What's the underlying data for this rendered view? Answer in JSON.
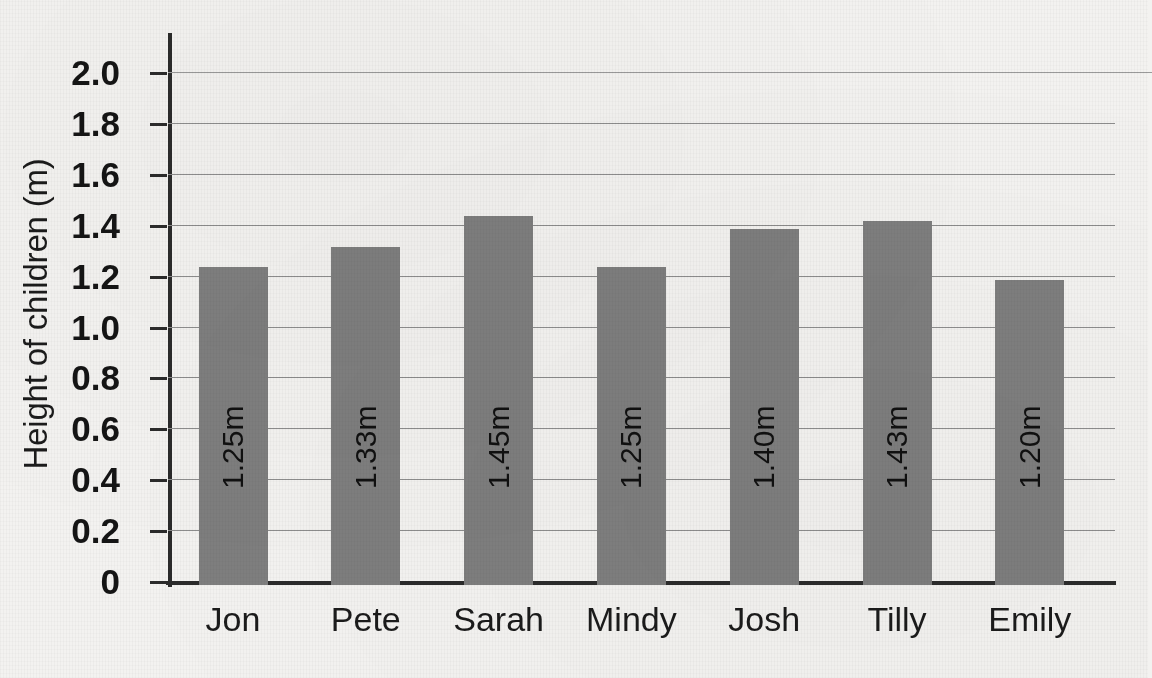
{
  "chart_data": {
    "type": "bar",
    "title": "",
    "subtitle": "",
    "xlabel": "",
    "ylabel": "Height of children (m)",
    "categories": [
      "Jon",
      "Pete",
      "Sarah",
      "Mindy",
      "Josh",
      "Tilly",
      "Emily"
    ],
    "values": [
      1.25,
      1.33,
      1.45,
      1.25,
      1.4,
      1.43,
      1.2
    ],
    "data_labels": [
      "1.25m",
      "1.33m",
      "1.45m",
      "1.25m",
      "1.40m",
      "1.43m",
      "1.20m"
    ],
    "ylim": [
      0,
      2.0
    ],
    "ytick_labels": [
      "2.0",
      "1.8",
      "1.6",
      "1.4",
      "1.2",
      "1.0",
      "0.8",
      "0.6",
      "0.4",
      "0.2",
      "0"
    ],
    "ytick_values": [
      2.0,
      1.8,
      1.6,
      1.4,
      1.2,
      1.0,
      0.8,
      0.6,
      0.4,
      0.2,
      0
    ],
    "grid": true,
    "legend": false,
    "legend_position": "none",
    "series": [
      {
        "name": "Height of children (m)",
        "values": [
          1.25,
          1.33,
          1.45,
          1.25,
          1.4,
          1.43,
          1.2
        ]
      }
    ],
    "colors": {
      "bar_fill": "#7e7e7e",
      "axis_line": "#2b2b2b",
      "gridline": "#8d8d8d",
      "background": "#f3f2f0",
      "text": "#1b1b1b",
      "data_label_text": "#101010"
    }
  }
}
